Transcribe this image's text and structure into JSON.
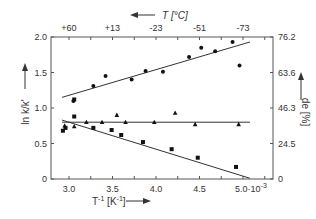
{
  "chart_data": {
    "type": "scatter",
    "title": "",
    "xlabel": "T^-1 [K^-1]",
    "ylabel_left": "ln k/k'",
    "ylabel_right": "de [%]",
    "top_axis_label": "T [°C]",
    "x_ticks": [
      "3.0",
      "3.5",
      "4.0",
      "4.5",
      "5.0·10^-3"
    ],
    "x_tick_values": [
      3.0,
      3.5,
      4.0,
      4.5,
      5.0
    ],
    "xlim": [
      2.8,
      5.3
    ],
    "x_scale_note": "×10^-3",
    "top_ticks": [
      "+60",
      "+13",
      "-23",
      "-51",
      "-73"
    ],
    "top_tick_values": [
      3.0,
      3.5,
      4.0,
      4.5,
      5.0
    ],
    "y_left_ticks": [
      "0",
      "0.5",
      "1.0",
      "1.5",
      "2.0"
    ],
    "y_left_tick_values": [
      0,
      0.5,
      1.0,
      1.5,
      2.0
    ],
    "ylim_left": [
      0,
      2.0
    ],
    "y_right_ticks": [
      "0",
      "24.5",
      "46.3",
      "63.6",
      "76.2"
    ],
    "y_right_tick_values": [
      0,
      0.5,
      1.0,
      1.5,
      2.0
    ],
    "grid": false,
    "legend": null,
    "series": [
      {
        "name": "ln k/k' (circles)",
        "marker": "circle",
        "points": [
          [
            3.05,
            1.1
          ],
          [
            3.28,
            1.31
          ],
          [
            3.42,
            1.45
          ],
          [
            3.72,
            1.4
          ],
          [
            3.88,
            1.52
          ],
          [
            4.08,
            1.51
          ],
          [
            4.38,
            1.72
          ],
          [
            4.52,
            1.85
          ],
          [
            4.68,
            1.8
          ],
          [
            4.88,
            1.93
          ],
          [
            4.96,
            1.6
          ]
        ],
        "fit_line": [
          [
            2.92,
            1.15
          ],
          [
            5.08,
            1.93
          ]
        ]
      },
      {
        "name": "ln k/k' (squares)",
        "marker": "square",
        "points": [
          [
            2.93,
            0.68
          ],
          [
            2.96,
            0.72
          ],
          [
            3.06,
            0.88
          ],
          [
            3.06,
            1.12
          ],
          [
            3.28,
            0.72
          ],
          [
            3.49,
            0.69
          ],
          [
            3.6,
            0.62
          ],
          [
            3.85,
            0.52
          ],
          [
            4.18,
            0.42
          ],
          [
            4.48,
            0.3
          ],
          [
            4.92,
            0.17
          ]
        ],
        "fit_line": [
          [
            2.92,
            0.83
          ],
          [
            5.08,
            0.01
          ]
        ]
      },
      {
        "name": "de [%] (triangles)",
        "marker": "triangle",
        "points": [
          [
            2.95,
            0.75
          ],
          [
            3.06,
            0.74
          ],
          [
            3.2,
            0.8
          ],
          [
            3.38,
            0.8
          ],
          [
            3.55,
            0.9
          ],
          [
            3.65,
            0.8
          ],
          [
            3.98,
            0.8
          ],
          [
            4.22,
            0.93
          ],
          [
            4.45,
            0.77
          ],
          [
            4.95,
            0.77
          ]
        ],
        "fit_line": [
          [
            2.92,
            0.8
          ],
          [
            5.08,
            0.8
          ]
        ]
      }
    ]
  }
}
